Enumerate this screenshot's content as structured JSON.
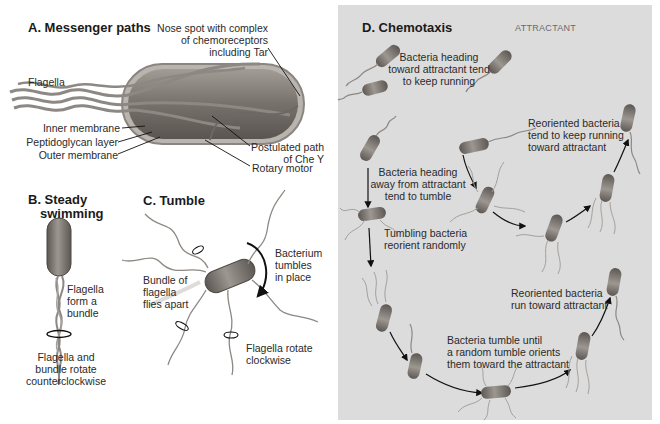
{
  "panel_a": {
    "title": "A. Messenger paths",
    "labels": {
      "nose_spot": [
        "Nose spot with complex",
        "of chemoreceptors",
        "including Tar"
      ],
      "flagella": "Flagella",
      "inner_membrane": "Inner membrane",
      "peptidoglycan": "Peptidoglycan layer",
      "outer_membrane": "Outer membrane",
      "chey_path": [
        "Postulated path",
        "of Che Y"
      ],
      "rotary_motor": "Rotary motor"
    }
  },
  "panel_b": {
    "title": [
      "B. Steady",
      "swimming"
    ],
    "labels": {
      "bundle": [
        "Flagella",
        "form a",
        "bundle"
      ],
      "rotation": [
        "Flagella and",
        "bundle rotate",
        "counterclockwise"
      ]
    }
  },
  "panel_c": {
    "title": "C. Tumble",
    "labels": {
      "tumbles": [
        "Bacterium",
        "tumbles",
        "in place"
      ],
      "flies_apart": [
        "Bundle of",
        "flagella",
        "flies apart"
      ],
      "clockwise": [
        "Flagella rotate",
        "clockwise"
      ]
    }
  },
  "panel_d": {
    "title": "D. Chemotaxis",
    "gradient_label": "Attractant",
    "background_color": "#dcdcdc",
    "labels": {
      "toward": [
        "Bacteria heading",
        "toward attractant tend",
        "to keep running"
      ],
      "away": [
        "Bacteria heading",
        "away from attractant",
        "tend to tumble"
      ],
      "tumbling": [
        "Tumbling bacteria",
        "reorient randomly"
      ],
      "reoriented_keep": [
        "Reoriented bacteria",
        "tend to keep running",
        "toward attractant"
      ],
      "reoriented_run": [
        "Reoriented bacteria",
        "run toward attractant"
      ],
      "tumble_until": [
        "Bacteria tumble until",
        "a random tumble orients",
        "them toward the attractant"
      ]
    }
  },
  "colors": {
    "bacterium_body": "#8a8580",
    "bacterium_dark": "#5e5a56",
    "flagella": "#9a9590",
    "arrow": "#111111",
    "panel_d_bg": "#dcdcdc"
  }
}
